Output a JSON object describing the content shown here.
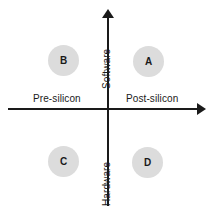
{
  "diagram": {
    "type": "2x2-quadrant-matrix",
    "background_color": "#ffffff",
    "axis_color": "#1a1a1a",
    "bubble_color": "#dcdcdc",
    "text_color": "#1a1a1a",
    "axes": {
      "vertical": {
        "name": "software-hardware-axis",
        "top_label": "Software",
        "bottom_label": "Hardware",
        "arrow": "up"
      },
      "horizontal": {
        "name": "silicon-stage-axis",
        "left_label": "Pre-silicon",
        "right_label": "Post-silicon",
        "arrow": "right"
      }
    },
    "quadrants": [
      {
        "id": "A",
        "label": "A",
        "position": "top-right",
        "x_axis": "Post-silicon",
        "y_axis": "Software"
      },
      {
        "id": "B",
        "label": "B",
        "position": "top-left",
        "x_axis": "Pre-silicon",
        "y_axis": "Software"
      },
      {
        "id": "C",
        "label": "C",
        "position": "bottom-left",
        "x_axis": "Pre-silicon",
        "y_axis": "Hardware"
      },
      {
        "id": "D",
        "label": "D",
        "position": "bottom-right",
        "x_axis": "Post-silicon",
        "y_axis": "Hardware"
      }
    ]
  }
}
